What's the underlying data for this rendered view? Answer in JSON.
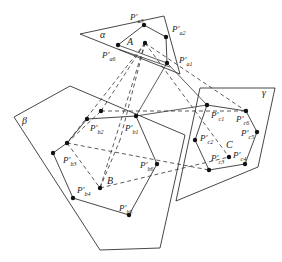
{
  "diagram": {
    "line_color": "#333333",
    "planes": [
      {
        "name": "alpha",
        "label": "α",
        "label_pos": [
          100,
          38
        ],
        "points": [
          [
            80,
            34
          ],
          [
            164,
            16
          ],
          [
            180,
            74
          ],
          [
            80,
            34
          ]
        ]
      },
      {
        "name": "beta",
        "label": "β",
        "label_pos": [
          22,
          124
        ],
        "points": [
          [
            14,
            117
          ],
          [
            70,
            86
          ],
          [
            185,
            135
          ],
          [
            160,
            248
          ],
          [
            100,
            250
          ],
          [
            14,
            117
          ]
        ]
      },
      {
        "name": "gamma",
        "label": "γ",
        "label_pos": [
          262,
          96
        ],
        "points": [
          [
            200,
            88
          ],
          [
            275,
            88
          ],
          [
            258,
            167
          ],
          [
            176,
            201
          ]
        ]
      }
    ],
    "polygons": [
      {
        "name": "polygon-a",
        "points": [
          [
            118,
            45
          ],
          [
            144,
            25
          ],
          [
            166,
            37
          ],
          [
            167,
            63
          ]
        ],
        "closing": "double-line"
      },
      {
        "name": "polygon-b",
        "points": [
          [
            136,
            116
          ],
          [
            87,
            119
          ],
          [
            67,
            143
          ],
          [
            53,
            153
          ],
          [
            73,
            198
          ],
          [
            129,
            215
          ],
          [
            157,
            164
          ]
        ]
      },
      {
        "name": "polygon-c",
        "points": [
          [
            207,
            105
          ],
          [
            246,
            111
          ],
          [
            257,
            132
          ],
          [
            245,
            164
          ],
          [
            209,
            170
          ],
          [
            195,
            140
          ]
        ]
      }
    ],
    "points": [
      {
        "name": "A",
        "label": "A",
        "pos": [
          145,
          43
        ],
        "label_pos": [
          127,
          45
        ]
      },
      {
        "name": "B",
        "label": "B",
        "pos": [
          100,
          188
        ],
        "label_pos": [
          107,
          184
        ]
      },
      {
        "name": "C",
        "label": "C",
        "pos": [
          229,
          157
        ],
        "label_pos": [
          226,
          148
        ]
      }
    ],
    "vertex_labels": [
      {
        "main": "P′",
        "sub": "a3",
        "pos": [
          130,
          20
        ]
      },
      {
        "main": "P′",
        "sub": "a2",
        "pos": [
          172,
          32
        ]
      },
      {
        "main": "P′",
        "sub": "a1",
        "pos": [
          179,
          63
        ]
      },
      {
        "main": "P′",
        "sub": "a6",
        "pos": [
          102,
          58
        ]
      },
      {
        "main": "P′",
        "sub": "b2",
        "pos": [
          90,
          131
        ]
      },
      {
        "main": "P′",
        "sub": "b1",
        "pos": [
          125,
          131
        ]
      },
      {
        "main": "P′",
        "sub": "b3",
        "pos": [
          63,
          163
        ]
      },
      {
        "main": "P′",
        "sub": "b4",
        "pos": [
          77,
          193
        ]
      },
      {
        "main": "P′",
        "sub": "b5",
        "pos": [
          119,
          211
        ]
      },
      {
        "main": "P′",
        "sub": "b6",
        "pos": [
          140,
          168
        ]
      },
      {
        "main": "P′",
        "sub": "c1",
        "pos": [
          211,
          118
        ]
      },
      {
        "main": "P′",
        "sub": "c6",
        "pos": [
          236,
          122
        ]
      },
      {
        "main": "P′",
        "sub": "c5",
        "pos": [
          241,
          136
        ]
      },
      {
        "main": "P′",
        "sub": "c2",
        "pos": [
          200,
          141
        ]
      },
      {
        "main": "P′",
        "sub": "c3",
        "pos": [
          211,
          161
        ]
      },
      {
        "main": "P′",
        "sub": "c4",
        "pos": [
          233,
          158
        ]
      }
    ]
  }
}
